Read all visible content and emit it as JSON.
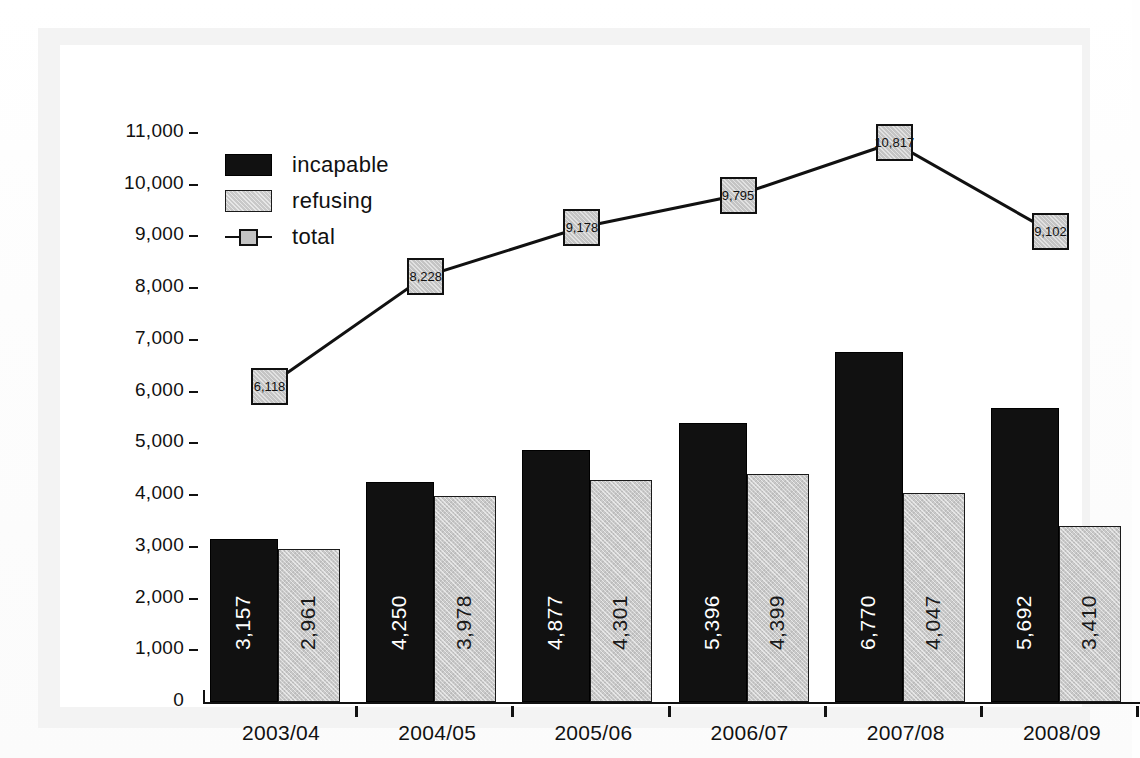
{
  "chart_data": {
    "type": "bar",
    "title": "",
    "subtitle": "",
    "xlabel": "",
    "ylabel": "",
    "categories": [
      "2003/04",
      "2004/05",
      "2005/06",
      "2006/07",
      "2007/08",
      "2008/09"
    ],
    "ylim": [
      0,
      11000
    ],
    "ytick_values": [
      0,
      1000,
      2000,
      3000,
      4000,
      5000,
      6000,
      7000,
      8000,
      9000,
      10000,
      11000
    ],
    "ytick_labels": [
      "0",
      "1,000",
      "2,000",
      "3,000",
      "4,000",
      "5,000",
      "6,000",
      "7,000",
      "8,000",
      "9,000",
      "10,000",
      "11,000"
    ],
    "grid": false,
    "legend_position": "top-left",
    "series": [
      {
        "name": "incapable",
        "kind": "bar",
        "color": "#111111",
        "values": [
          3157,
          4250,
          4877,
          5396,
          6770,
          5692
        ],
        "labels": [
          "3,157",
          "4,250",
          "4,877",
          "5,396",
          "6,770",
          "5,692"
        ]
      },
      {
        "name": "refusing",
        "kind": "bar",
        "color": "#c9c9c9",
        "values": [
          2961,
          3978,
          4301,
          4399,
          4047,
          3410
        ],
        "labels": [
          "2,961",
          "3,978",
          "4,301",
          "4,399",
          "4,047",
          "3,410"
        ]
      },
      {
        "name": "total",
        "kind": "line",
        "color": "#111111",
        "marker_color": "#c4c4c4",
        "values": [
          6118,
          8228,
          9178,
          9795,
          10817,
          9102
        ],
        "labels": [
          "6,118",
          "8,228",
          "9,178",
          "9,795",
          "10,817",
          "9,102"
        ]
      }
    ]
  },
  "legend": {
    "items": [
      {
        "label": "incapable",
        "type": "swatch-black"
      },
      {
        "label": "refusing",
        "type": "swatch-gray"
      },
      {
        "label": "total",
        "type": "line-marker"
      }
    ]
  },
  "axis": {
    "y_labels": [
      "11,000",
      "10,000",
      "9,000",
      "8,000",
      "7,000",
      "6,000",
      "5,000",
      "4,000",
      "3,000",
      "2,000",
      "1,000",
      "0"
    ],
    "x_labels": [
      "2003/04",
      "2004/05",
      "2005/06",
      "2006/07",
      "2007/08",
      "2008/09"
    ]
  },
  "colors": {
    "incapable": "#111111",
    "refusing": "#c9c9c9",
    "total_line": "#111111",
    "total_marker": "#c4c4c4",
    "background": "#ffffff",
    "frame": "#f3f3f3"
  }
}
